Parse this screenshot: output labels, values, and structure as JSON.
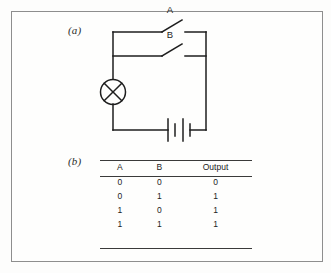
{
  "figure": {
    "panel_a_label": "(a)",
    "panel_b_label": "(b)"
  },
  "circuit": {
    "switch_a_label": "A",
    "switch_b_label": "B",
    "components": {
      "lamp": "lamp-symbol",
      "battery": "battery-symbol",
      "switch_a": "open-switch",
      "switch_b": "open-switch"
    }
  },
  "truth_table": {
    "headers": [
      "A",
      "B",
      "Output"
    ],
    "rows": [
      [
        "0",
        "0",
        "0"
      ],
      [
        "0",
        "1",
        "1"
      ],
      [
        "1",
        "0",
        "1"
      ],
      [
        "1",
        "1",
        "1"
      ]
    ]
  },
  "colors": {
    "ink": "#1e1e1e",
    "rule": "#3a3a3a",
    "frame": "#8e8e8e",
    "background": "#fdfdfc"
  }
}
